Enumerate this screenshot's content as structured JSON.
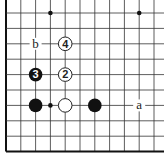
{
  "diagram": {
    "type": "go-board-fragment",
    "grid": {
      "origin_x": 6,
      "origin_y": 13,
      "spacing_x": 14.8,
      "spacing_y": 15.4,
      "cols": 11,
      "rows": 10,
      "left_edge": true,
      "bottom_edge": true,
      "line_color": "#333333",
      "edge_color": "#111111"
    },
    "star_points": [
      {
        "col": 3,
        "row": 0
      },
      {
        "col": 9,
        "row": 0
      },
      {
        "col": 3,
        "row": 6
      }
    ],
    "stones": [
      {
        "color": "black",
        "col": 2,
        "row": 6,
        "label": ""
      },
      {
        "color": "white",
        "col": 4,
        "row": 6,
        "label": ""
      },
      {
        "color": "black",
        "col": 6,
        "row": 6,
        "label": ""
      },
      {
        "color": "white",
        "col": 4,
        "row": 4,
        "label": "2"
      },
      {
        "color": "black",
        "col": 2,
        "row": 4,
        "label": "3"
      },
      {
        "color": "white",
        "col": 4,
        "row": 2,
        "label": "4"
      }
    ],
    "marks": [
      {
        "text": "a",
        "col": 9,
        "row": 6
      },
      {
        "text": "b",
        "col": 2,
        "row": 2
      }
    ]
  }
}
